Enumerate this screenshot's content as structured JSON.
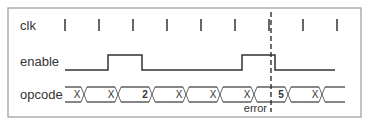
{
  "diagram": {
    "type": "timing-diagram",
    "signals": [
      {
        "name": "clk",
        "kind": "clock",
        "ticks": 9
      },
      {
        "name": "enable",
        "kind": "digital",
        "levels": [
          0,
          1,
          0,
          0,
          0,
          1,
          0,
          0
        ],
        "edges_note": "high between tick 2.5-3.5 and tick 6.5-7.5 (approx)"
      },
      {
        "name": "opcode",
        "kind": "bus",
        "values": [
          "X",
          "X",
          "2",
          "X",
          "X",
          "X",
          "5",
          "X"
        ],
        "bold_values": [
          "2",
          "5"
        ]
      }
    ],
    "marker": {
      "label": "error",
      "style": "dashed",
      "at_clock_tick": 7
    }
  }
}
